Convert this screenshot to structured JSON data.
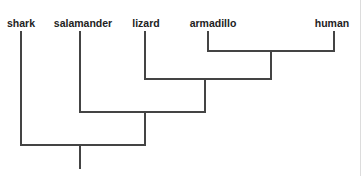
{
  "diagram": {
    "type": "cladogram",
    "taxa": [
      {
        "label": "shark",
        "x": 21
      },
      {
        "label": "salamander",
        "x": 80
      },
      {
        "label": "lizard",
        "x": 145
      },
      {
        "label": "armadillo",
        "x": 208
      },
      {
        "label": "human",
        "x": 334
      }
    ],
    "line_color": "#444444",
    "nodes": [
      {
        "name": "armadillo-human",
        "x": 271,
        "y": 51
      },
      {
        "name": "lizard-mammals",
        "x": 205,
        "y": 79
      },
      {
        "name": "salamander-amniotes",
        "x": 145,
        "y": 112
      },
      {
        "name": "root",
        "x": 80,
        "y": 145
      }
    ]
  }
}
